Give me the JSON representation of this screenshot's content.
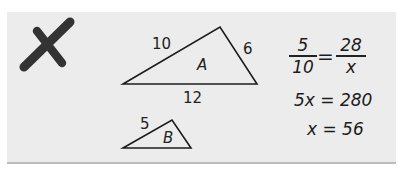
{
  "mark": {
    "icon": "x-mark-icon",
    "color": "#333333",
    "meaning": "incorrect"
  },
  "triangle_a": {
    "name": "A",
    "sides": {
      "left": "10",
      "right": "6",
      "bottom": "12"
    }
  },
  "triangle_b": {
    "name": "B",
    "sides": {
      "left": "5"
    }
  },
  "work": {
    "proportion": {
      "left_numerator": "5",
      "left_denominator": "10",
      "equals": "=",
      "right_numerator": "28",
      "right_denominator": "x"
    },
    "step1": "5x = 280",
    "step2": "x = 56"
  },
  "colors": {
    "card_background": "#ececec",
    "page_background": "#ffffff",
    "ink": "#222222"
  }
}
